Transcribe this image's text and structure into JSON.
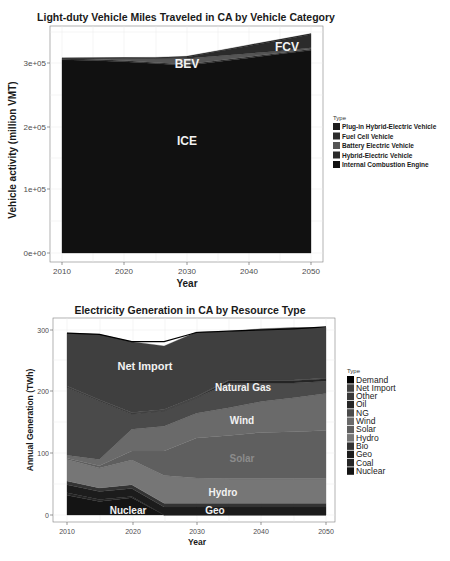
{
  "chart_data": [
    {
      "type": "area",
      "stacked": true,
      "title": "Light-duty Vehicle Miles Traveled in CA by Vehicle Category",
      "xlabel": "Year",
      "ylabel": "Vehicle activity (million VMT)",
      "x": [
        2010,
        2015,
        2020,
        2025,
        2030,
        2035,
        2040,
        2045,
        2050
      ],
      "xticks": [
        "2010",
        "2020",
        "2030",
        "2040",
        "2050"
      ],
      "yticks": [
        "0e+00",
        "1e+05",
        "2e+05",
        "3e+05"
      ],
      "ylim": [
        0,
        350000
      ],
      "xlim": [
        2010,
        2050
      ],
      "grid": true,
      "legend_position": "right",
      "legend_title": "Type",
      "series": [
        {
          "name": "Internal Combustion Engine",
          "color": "#111111",
          "values": [
            305000,
            304000,
            302000,
            299000,
            296000,
            302000,
            308000,
            314000,
            320000
          ]
        },
        {
          "name": "Hybrid-Electric Vehicle",
          "color": "#2a2a2a",
          "values": [
            2000,
            2000,
            2000,
            2000,
            2000,
            2000,
            2000,
            2000,
            2000
          ]
        },
        {
          "name": "Battery Electric Vehicle",
          "color": "#555555",
          "values": [
            500,
            1500,
            3500,
            6000,
            9000,
            7000,
            5000,
            3000,
            2000
          ]
        },
        {
          "name": "Fuel Cell Vehicle",
          "color": "#2b2b2b",
          "values": [
            0,
            0,
            200,
            600,
            2000,
            7000,
            12000,
            17000,
            21000
          ]
        },
        {
          "name": "Plug-in Hybrid-Electric Vehicle",
          "color": "#1e1e1e",
          "values": [
            500,
            800,
            1000,
            1200,
            1500,
            1500,
            1500,
            1500,
            1500
          ]
        }
      ],
      "legend_order": [
        "Plug-in Hybrid-Electric Vehicle",
        "Fuel Cell Vehicle",
        "Battery Electric Vehicle",
        "Hybrid-Electric Vehicle",
        "Internal Combustion Engine"
      ],
      "annotations": [
        {
          "text": "BEV",
          "x": 2028,
          "y": 290000
        },
        {
          "text": "FCV",
          "x": 2046,
          "y": 320000
        },
        {
          "text": "ICE",
          "x": 2028,
          "y": 175000
        }
      ]
    },
    {
      "type": "area",
      "stacked": true,
      "title": "Electricity Generation in CA by Resource Type",
      "xlabel": "Year",
      "ylabel": "Annual Generation (TWh)",
      "x": [
        2010,
        2015,
        2020,
        2025,
        2030,
        2035,
        2040,
        2045,
        2050
      ],
      "xticks": [
        "2010",
        "2020",
        "2030",
        "2040",
        "2050"
      ],
      "yticks": [
        "0",
        "100",
        "200",
        "300"
      ],
      "ylim": [
        0,
        310
      ],
      "xlim": [
        2010,
        2050
      ],
      "grid": true,
      "legend_position": "right",
      "legend_title": "Type",
      "series": [
        {
          "name": "Nuclear",
          "color": "#141414",
          "values": [
            32,
            22,
            28,
            0,
            0,
            0,
            0,
            0,
            0
          ]
        },
        {
          "name": "Coal",
          "color": "#262626",
          "values": [
            4,
            3,
            2,
            0,
            0,
            0,
            0,
            0,
            0
          ]
        },
        {
          "name": "Geo",
          "color": "#1c1c1c",
          "values": [
            13,
            13,
            13,
            13,
            13,
            13,
            13,
            13,
            13
          ]
        },
        {
          "name": "Bio",
          "color": "#333333",
          "values": [
            6,
            6,
            6,
            6,
            6,
            6,
            6,
            6,
            6
          ]
        },
        {
          "name": "Hydro",
          "color": "#767676",
          "values": [
            35,
            32,
            40,
            45,
            41,
            40,
            40,
            40,
            40
          ]
        },
        {
          "name": "Solar",
          "color": "#5f5f5f",
          "values": [
            2,
            4,
            15,
            40,
            65,
            70,
            75,
            76,
            78
          ]
        },
        {
          "name": "Wind",
          "color": "#6a6a6a",
          "values": [
            5,
            10,
            35,
            40,
            40,
            45,
            50,
            55,
            60
          ]
        },
        {
          "name": "NG",
          "color": "#4a4a4a",
          "values": [
            110,
            95,
            25,
            25,
            25,
            40,
            30,
            24,
            20
          ]
        },
        {
          "name": "Oil",
          "color": "#252525",
          "values": [
            1,
            1,
            1,
            1,
            1,
            4,
            4,
            4,
            4
          ]
        },
        {
          "name": "Other",
          "color": "#3a3a3a",
          "values": [
            1,
            1,
            1,
            1,
            1,
            1,
            1,
            1,
            1
          ]
        },
        {
          "name": "Net Import",
          "color": "#3f3f3f",
          "values": [
            86,
            106,
            115,
            103,
            105,
            79,
            83,
            85,
            82
          ]
        },
        {
          "name": "Demand",
          "color": "#000000",
          "values": [
            295,
            293,
            281,
            281,
            296,
            298,
            300,
            302,
            305
          ]
        }
      ],
      "legend_order": [
        "Demand",
        "Net Import",
        "Other",
        "Oil",
        "NG",
        "Wind",
        "Solar",
        "Hydro",
        "Bio",
        "Geo",
        "Coal",
        "Nuclear"
      ],
      "annotations": [
        {
          "text": "Net Import",
          "x": 2023,
          "y": 250
        },
        {
          "text": "Natural Gas",
          "x": 2036,
          "y": 210
        },
        {
          "text": "Wind",
          "x": 2034,
          "y": 170
        },
        {
          "text": "Solar",
          "x": 2039,
          "y": 90
        },
        {
          "text": "Hydro",
          "x": 2035,
          "y": 40
        },
        {
          "text": "Nuclear",
          "x": 2020,
          "y": 6
        },
        {
          "text": "Geo",
          "x": 2031,
          "y": 6
        }
      ]
    }
  ],
  "chart1": {
    "title": "Light-duty Vehicle Miles Traveled in CA by Vehicle Category",
    "xlabel": "Year",
    "ylabel": "Vehicle activity (million VMT)",
    "xticks": [
      "2010",
      "2020",
      "2030",
      "2040",
      "2050"
    ],
    "yticks": [
      "0e+00",
      "1e+05",
      "2e+05",
      "3e+05"
    ],
    "legend_title": "Type",
    "legend": [
      "Plug-in Hybrid-Electric Vehicle",
      "Fuel Cell Vehicle",
      "Battery Electric Vehicle",
      "Hybrid-Electric Vehicle",
      "Internal Combustion Engine"
    ],
    "labels": {
      "bev": "BEV",
      "fcv": "FCV",
      "ice": "ICE"
    }
  },
  "chart2": {
    "title": "Electricity Generation in CA by Resource Type",
    "xlabel": "Year",
    "ylabel": "Annual Generation (TWh)",
    "xticks": [
      "2010",
      "2020",
      "2030",
      "2040",
      "2050"
    ],
    "yticks": [
      "0",
      "100",
      "200",
      "300"
    ],
    "legend_title": "Type",
    "legend": [
      "Demand",
      "Net Import",
      "Other",
      "Oil",
      "NG",
      "Wind",
      "Solar",
      "Hydro",
      "Bio",
      "Geo",
      "Coal",
      "Nuclear"
    ],
    "labels": {
      "net_import": "Net Import",
      "natural_gas": "Natural Gas",
      "wind": "Wind",
      "solar": "Solar",
      "hydro": "Hydro",
      "nuclear": "Nuclear",
      "geo": "Geo"
    }
  }
}
